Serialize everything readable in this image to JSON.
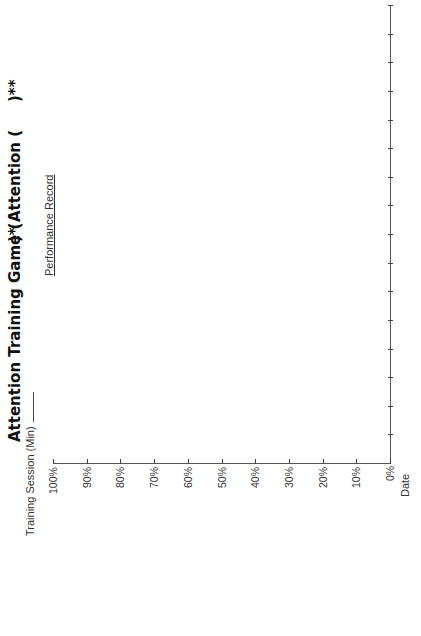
{
  "document": {
    "orientation": "rotated-90-ccw",
    "title_part1": "Attention Training Game (",
    "title_part2": ")* Attention (",
    "title_part3": ")**",
    "subtitle": "Performance Record",
    "session_label": "Training Session (Min)"
  },
  "chart_data": {
    "type": "line",
    "title": "Performance Record",
    "xlabel": "Date",
    "ylabel": "",
    "ylim": [
      0,
      100
    ],
    "y_ticks": [
      "0%",
      "10%",
      "20%",
      "30%",
      "40%",
      "50%",
      "60%",
      "70%",
      "80%",
      "90%",
      "100%"
    ],
    "x_tick_count": 16,
    "categories": [],
    "series": [],
    "grid": false,
    "note": "Blank record chart with no plotted data"
  }
}
